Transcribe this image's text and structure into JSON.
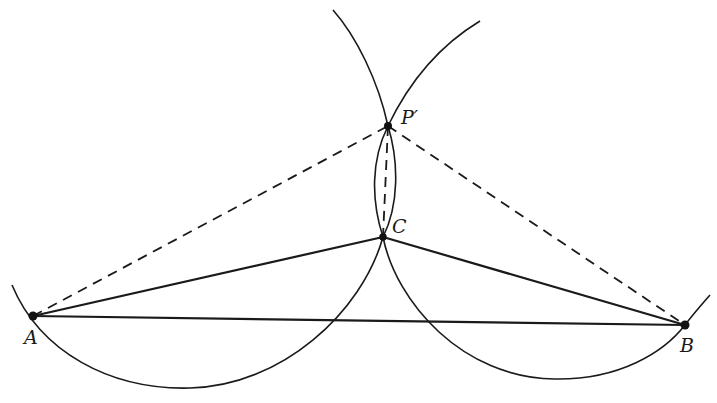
{
  "diagram": {
    "type": "geometric-construction",
    "points": {
      "A": {
        "label": "A",
        "x": 33,
        "y": 316,
        "label_x": 24,
        "label_y": 344
      },
      "B": {
        "label": "B",
        "x": 685,
        "y": 325,
        "label_x": 680,
        "label_y": 352
      },
      "C": {
        "label": "C",
        "x": 383,
        "y": 237,
        "label_x": 392,
        "label_y": 233
      },
      "P_prime": {
        "label": "P′",
        "x": 388,
        "y": 126,
        "label_x": 402,
        "label_y": 124
      }
    },
    "solid_segments": [
      {
        "from": "A",
        "to": "B"
      },
      {
        "from": "A",
        "to": "C"
      },
      {
        "from": "C",
        "to": "B"
      }
    ],
    "dashed_segments": [
      {
        "from": "A",
        "to": "P_prime"
      },
      {
        "from": "P_prime",
        "to": "B"
      },
      {
        "from": "P_prime",
        "to": "C"
      }
    ],
    "arcs": [
      {
        "name": "left-arc",
        "through": [
          "A",
          "C",
          "P_prime"
        ]
      },
      {
        "name": "right-arc",
        "through": [
          "P_prime",
          "C",
          "B"
        ]
      }
    ],
    "colors": {
      "ink": "#1a1a1a",
      "background": "#ffffff"
    }
  }
}
